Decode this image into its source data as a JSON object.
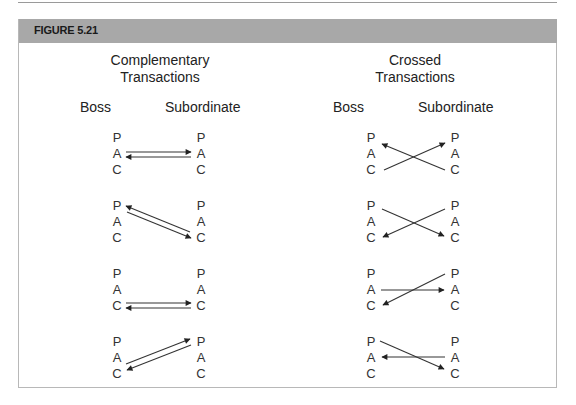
{
  "figure": {
    "label": "FIGURE 5.21",
    "header_color": "#a8a8a8",
    "border_color": "#b8b8b8"
  },
  "panels": [
    {
      "title_line1": "Complementary",
      "title_line2": "Transactions",
      "left_label": "Boss",
      "right_label": "Subordinate",
      "diagrams": [
        {
          "letters": [
            "P",
            "A",
            "C"
          ],
          "arrows": [
            {
              "from": "Boss.A",
              "to": "Sub.A"
            },
            {
              "from": "Sub.A",
              "to": "Boss.A"
            }
          ]
        },
        {
          "letters": [
            "P",
            "A",
            "C"
          ],
          "arrows": [
            {
              "from": "Sub.C",
              "to": "Boss.P"
            },
            {
              "from": "Boss.P",
              "to": "Sub.C"
            }
          ]
        },
        {
          "letters": [
            "P",
            "A",
            "C"
          ],
          "arrows": [
            {
              "from": "Boss.C",
              "to": "Sub.C"
            },
            {
              "from": "Sub.C",
              "to": "Boss.C"
            }
          ]
        },
        {
          "letters": [
            "P",
            "A",
            "C"
          ],
          "arrows": [
            {
              "from": "Boss.C",
              "to": "Sub.P"
            },
            {
              "from": "Sub.P",
              "to": "Boss.C"
            }
          ]
        }
      ]
    },
    {
      "title_line1": "Crossed",
      "title_line2": "Transactions",
      "left_label": "Boss",
      "right_label": "Subordinate",
      "diagrams": [
        {
          "letters": [
            "P",
            "A",
            "C"
          ],
          "arrows": [
            {
              "from": "Boss.C",
              "to": "Sub.P"
            },
            {
              "from": "Sub.C",
              "to": "Boss.P"
            }
          ]
        },
        {
          "letters": [
            "P",
            "A",
            "C"
          ],
          "arrows": [
            {
              "from": "Boss.P",
              "to": "Sub.C"
            },
            {
              "from": "Sub.P",
              "to": "Boss.C"
            }
          ]
        },
        {
          "letters": [
            "P",
            "A",
            "C"
          ],
          "arrows": [
            {
              "from": "Boss.A",
              "to": "Sub.A"
            },
            {
              "from": "Sub.P",
              "to": "Boss.C"
            }
          ]
        },
        {
          "letters": [
            "P",
            "A",
            "C"
          ],
          "arrows": [
            {
              "from": "Boss.P",
              "to": "Sub.C"
            },
            {
              "from": "Sub.A",
              "to": "Boss.A"
            }
          ]
        }
      ]
    }
  ]
}
